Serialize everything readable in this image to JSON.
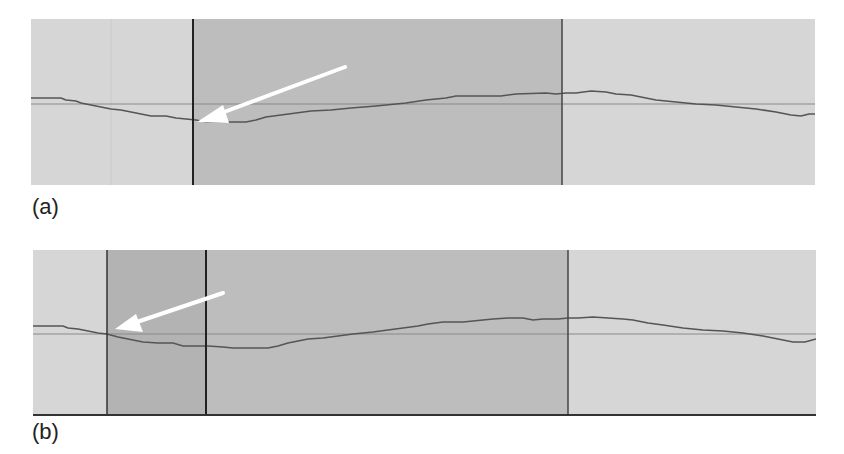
{
  "figure": {
    "panels": [
      {
        "id": "a",
        "label": "(a)",
        "description": "Waveform editor view; selection region with cursor at left edge, arrow pointing to the cursor where it meets the trace",
        "background_color": "#d6d6d6",
        "selection_color": "#bdbdbd",
        "selection": {
          "start_x": 162,
          "end_x": 531
        },
        "cursor_lines_x": [
          162,
          531
        ],
        "baseline_y": 85,
        "arrow": {
          "from": [
            314,
            48
          ],
          "to": [
            166,
            103
          ]
        }
      },
      {
        "id": "b",
        "label": "(b)",
        "description": "Waveform editor view; selection extended left, arrow pointing to the new left cursor at the trace crossing",
        "background_color": "#d6d6d6",
        "selection_color": "#bdbdbd",
        "inner_selection_color": "#b0b0b0",
        "selection": {
          "start_x": 74,
          "end_x": 535
        },
        "cursor_lines_x": [
          74,
          173,
          535
        ],
        "baseline_y": 84,
        "arrow": {
          "from": [
            190,
            43
          ],
          "to": [
            82,
            79
          ]
        }
      }
    ],
    "colors": {
      "trace": "#555555",
      "baseline": "#8a8a8a",
      "cursor": "#222222",
      "arrow": "#ffffff"
    }
  }
}
